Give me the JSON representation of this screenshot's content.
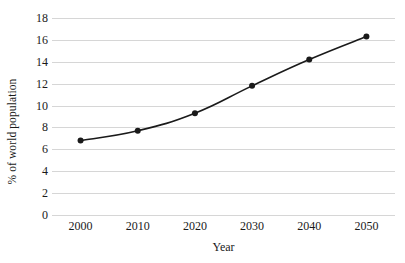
{
  "chart_data": {
    "type": "line",
    "title": "",
    "xlabel": "Year",
    "ylabel": "% of world population",
    "categories": [
      "2000",
      "2010",
      "2020",
      "2030",
      "2040",
      "2050"
    ],
    "x": [
      2000,
      2010,
      2020,
      2030,
      2040,
      2050
    ],
    "values": [
      6.8,
      7.7,
      9.3,
      11.8,
      14.2,
      16.3
    ],
    "series": [
      {
        "name": "% of world population",
        "values": [
          6.8,
          7.7,
          9.3,
          11.8,
          14.2,
          16.3
        ]
      }
    ],
    "ylim": [
      0,
      18
    ],
    "ytick_labels": [
      "0",
      "2",
      "4",
      "6",
      "8",
      "10",
      "12",
      "14",
      "16",
      "18"
    ],
    "yticks": [
      0,
      2,
      4,
      6,
      8,
      10,
      12,
      14,
      16,
      18
    ],
    "xlim": [
      1995,
      2055
    ],
    "grid": "horizontal",
    "legend": "none",
    "annotations": [],
    "line_color": "#1a1a1a",
    "marker_color": "#1a1a1a",
    "gridline_color": "#d6d6d6",
    "background_color": "#ffffff",
    "text_color": "#1a1a1a"
  }
}
